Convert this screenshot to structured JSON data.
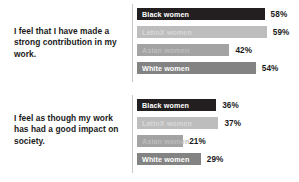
{
  "chart_data": [
    {
      "type": "bar",
      "orientation": "horizontal",
      "title": "I feel that I have made a strong contribution in my work.",
      "categories": [
        "Black women",
        "LatinX women",
        "Asian women",
        "White women"
      ],
      "values": [
        58,
        59,
        42,
        54
      ],
      "value_labels": [
        "58%",
        "59%",
        "42%",
        "54%"
      ],
      "xlabel": "",
      "ylabel": "",
      "xlim": [
        0,
        100
      ],
      "grid": false,
      "legend": "none",
      "colors": [
        "#231f20",
        "#bdbdbd",
        "#a3a3a3",
        "#838383"
      ],
      "label_colors": [
        "#ffffff",
        "#d8d8d8",
        "#bdbdbd",
        "#ffffff"
      ]
    },
    {
      "type": "bar",
      "orientation": "horizontal",
      "title": "I feel as though my work has had a good impact on society.",
      "categories": [
        "Black women",
        "LatinX women",
        "Asian women",
        "White women"
      ],
      "values": [
        36,
        37,
        21,
        29
      ],
      "value_labels": [
        "36%",
        "37%",
        "21%",
        "29%"
      ],
      "xlabel": "",
      "ylabel": "",
      "xlim": [
        0,
        100
      ],
      "grid": false,
      "legend": "none",
      "colors": [
        "#231f20",
        "#bdbdbd",
        "#a3a3a3",
        "#838383"
      ],
      "label_colors": [
        "#ffffff",
        "#d8d8d8",
        "#bdbdbd",
        "#ffffff"
      ]
    }
  ]
}
